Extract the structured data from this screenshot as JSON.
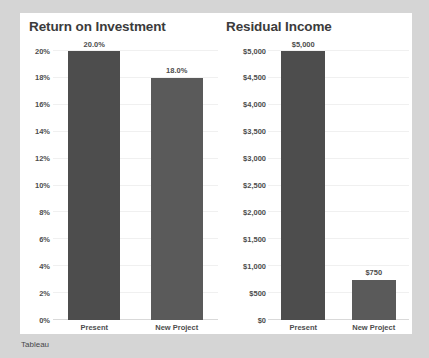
{
  "footer": {
    "label": "Tableau"
  },
  "chart_data": [
    {
      "type": "bar",
      "title": "Return on Investment",
      "xlabel": "",
      "ylabel": "",
      "categories": [
        "Present",
        "New Project"
      ],
      "values": [
        0.2,
        0.18
      ],
      "value_labels": [
        "20.0%",
        "18.0%"
      ],
      "ylim": [
        0,
        0.2
      ],
      "yticks": [
        0,
        0.02,
        0.04,
        0.06,
        0.08,
        0.1,
        0.12,
        0.14,
        0.16,
        0.18,
        0.2
      ],
      "ytick_labels": [
        "0%",
        "2%",
        "4%",
        "6%",
        "8%",
        "10%",
        "12%",
        "14%",
        "16%",
        "18%",
        "20%"
      ],
      "grid": true,
      "legend": "none",
      "bar_colors": [
        "#4d4d4d",
        "#5a5a5a"
      ]
    },
    {
      "type": "bar",
      "title": "Residual Income",
      "xlabel": "",
      "ylabel": "",
      "categories": [
        "Present",
        "New Project"
      ],
      "values": [
        5000,
        750
      ],
      "value_labels": [
        "$5,000",
        "$750"
      ],
      "ylim": [
        0,
        5000
      ],
      "yticks": [
        0,
        500,
        1000,
        1500,
        2000,
        2500,
        3000,
        3500,
        4000,
        4500,
        5000
      ],
      "ytick_labels": [
        "$0",
        "$500",
        "$1,000",
        "$1,500",
        "$2,000",
        "$2,500",
        "$3,000",
        "$3,500",
        "$4,000",
        "$4,500",
        "$5,000"
      ],
      "grid": true,
      "legend": "none",
      "bar_colors": [
        "#4d4d4d",
        "#5a5a5a"
      ]
    }
  ]
}
